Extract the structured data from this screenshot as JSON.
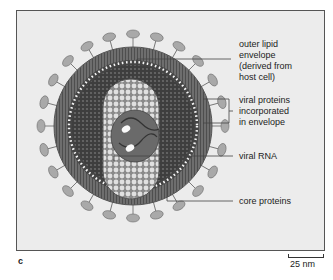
{
  "figure": {
    "panel_letter": "c",
    "scale_bar": {
      "label": "25  nm"
    },
    "labels": [
      {
        "id": "envelope",
        "lines": [
          "outer lipid",
          "envelope",
          "(derived from",
          "host cell)"
        ]
      },
      {
        "id": "viral-proteins",
        "lines": [
          "viral proteins",
          "incorporated",
          "in envelope"
        ]
      },
      {
        "id": "rna",
        "lines": [
          "viral RNA"
        ]
      },
      {
        "id": "core",
        "lines": [
          "core proteins"
        ]
      }
    ],
    "colors": {
      "background": "#ececec",
      "spike": "#a8a8a8",
      "envelope": "#7a7a7a",
      "matrix": "#4a4a4a",
      "core": "#c8c8c8",
      "leader_line": "#444444"
    }
  }
}
